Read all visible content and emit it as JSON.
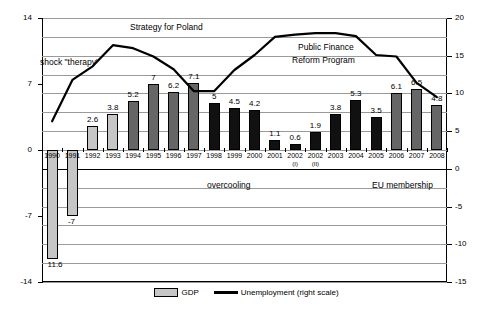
{
  "chart_data": {
    "type": "bar",
    "title": "",
    "xlabel": "",
    "ylabel": "",
    "ylim": [
      -14,
      14
    ],
    "y2lim": [
      -15,
      20
    ],
    "grid": true,
    "legend_position": "bottom",
    "categories": [
      "1990",
      "1991",
      "1992",
      "1993",
      "1994",
      "1995",
      "1996",
      "1997",
      "1998",
      "1999",
      "2000",
      "2001",
      "2002",
      "2002",
      "2003",
      "2004",
      "2005",
      "2006",
      "2007",
      "2008"
    ],
    "category_sublabels": [
      "",
      "",
      "",
      "",
      "",
      "",
      "",
      "",
      "",
      "",
      "",
      "",
      "(I)",
      "(II)",
      "",
      "",
      "",
      "",
      "",
      ""
    ],
    "yticks_left": [
      "14",
      "7",
      "0",
      "-7",
      "-14"
    ],
    "yticks_right": [
      "20",
      "15",
      "10",
      "5",
      "0",
      "-5",
      "-10",
      "-15"
    ],
    "series": [
      {
        "name": "GDP",
        "type": "bar",
        "axis": "left",
        "values": [
          -11.6,
          -7,
          2.6,
          3.8,
          5.2,
          7,
          6.2,
          7.1,
          5,
          4.5,
          4.2,
          1.1,
          0.6,
          1.9,
          3.8,
          5.3,
          3.5,
          6.1,
          6.5,
          4.8
        ],
        "value_labels": [
          "11.6",
          "-7",
          "2.6",
          "3.8",
          "5.2",
          "7",
          "6.2",
          "7.1",
          "5",
          "4.5",
          "4.2",
          "1.1",
          "0.6",
          "1.9",
          "3.8",
          "5.3",
          "3.5",
          "6.1",
          "6.5",
          "4.8"
        ],
        "shades": [
          "light",
          "light",
          "light",
          "light",
          "mid",
          "mid",
          "mid",
          "mid",
          "dark",
          "dark",
          "dark",
          "dark",
          "dark",
          "dark",
          "dark",
          "dark",
          "dark",
          "mid",
          "mid",
          "mid"
        ]
      },
      {
        "name": "Unemployment (right scale)",
        "type": "line",
        "axis": "right",
        "values": [
          6.3,
          11.8,
          13.6,
          16.4,
          16.0,
          14.9,
          13.2,
          10.3,
          10.3,
          13.1,
          15.1,
          17.5,
          17.8,
          18.0,
          18.0,
          17.6,
          15.1,
          14.9,
          11.4,
          9.5
        ]
      }
    ],
    "annotations": [
      {
        "text": "Strategy for Poland"
      },
      {
        "text": "shock \"therapy\""
      },
      {
        "text": "Public Finance"
      },
      {
        "text": "Reform Program"
      },
      {
        "text": "overcooling"
      },
      {
        "text": "EU membership"
      }
    ],
    "legend": [
      {
        "label": "GDP",
        "marker": "bar-swatch-gray"
      },
      {
        "label": "Unemployment (right scale)",
        "marker": "line-swatch-black"
      }
    ],
    "colors": {
      "bar_light": "#c6c6c6",
      "bar_mid": "#666666",
      "bar_dark": "#111111",
      "line": "#000000",
      "grid": "#9a9a9a",
      "axis": "#000000"
    }
  }
}
